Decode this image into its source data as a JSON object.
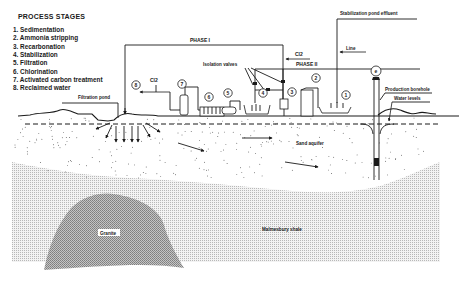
{
  "legend": {
    "title": "PROCESS STAGES",
    "items": [
      {
        "num": "1.",
        "label": "Sedimentation"
      },
      {
        "num": "2.",
        "label": "Ammonia stripping"
      },
      {
        "num": "3.",
        "label": "Recarbonation"
      },
      {
        "num": "4.",
        "label": "Stabilization"
      },
      {
        "num": "5.",
        "label": "Filtration"
      },
      {
        "num": "6.",
        "label": "Chlorination"
      },
      {
        "num": "7.",
        "label": "Activated carbon treatment"
      },
      {
        "num": "8.",
        "label": "Reclaimed water"
      }
    ]
  },
  "labels": {
    "phase1": "PHASE I",
    "phase2": "PHASE II",
    "cl2_top": "Cl2",
    "cl2_left": "Cl2",
    "line": "Line",
    "stabilization_effluent": "Stabilization pond effluent",
    "isolation_valves": "Isolation valves",
    "filtration_pond": "Filtration pond",
    "production_borehole": "Production borehole",
    "water_levels": "Water levels",
    "sand_aquifer": "Sand aquifer",
    "granite": "Granite",
    "malmesbury_shale": "Malmesbury shale"
  },
  "stage_markers": [
    "1",
    "2",
    "3",
    "4",
    "5",
    "6",
    "7",
    "8"
  ],
  "colors": {
    "ink": "#1a1a1a",
    "shale_fill": "#d8d8d8",
    "granite_fill": "#a8a8a8",
    "background": "#ffffff"
  }
}
